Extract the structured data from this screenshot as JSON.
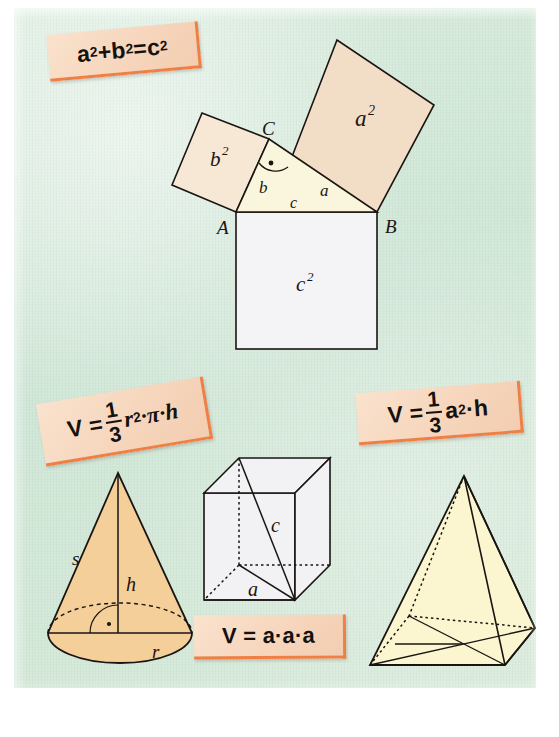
{
  "page": {
    "background_color": "#d6e9da",
    "panel_texture": "paper-grain"
  },
  "colors": {
    "background_green": "#d6e9da",
    "sticker_fill": "#f6d6bd",
    "sticker_edge": "#ef7f44",
    "square_a_fill": "#f2ddc7",
    "square_b_fill": "#f7e7d5",
    "square_c_fill": "#f4f3f6",
    "triangle_fill": "#faf6dd",
    "cone_fill": "#f5cf9a",
    "cube_fill": "#f2f2f5",
    "pyramid_fill": "#fbf6d0",
    "stroke": "#1a1512"
  },
  "stickers": [
    {
      "id": "pythagoras",
      "name": "pythagorean-theorem-formula",
      "parts": [
        "a",
        "2",
        " + ",
        "b",
        "2",
        " = ",
        "c",
        "2"
      ],
      "plain_text": "a² + b² = c²"
    },
    {
      "id": "cone",
      "name": "cone-volume-formula",
      "lead": "V =",
      "numerator": "1",
      "denominator": "3",
      "tail_base": "r",
      "tail_exp": "2",
      "tail_rest": "·π·h",
      "plain_text": "V = 1/3 r²·π·h"
    },
    {
      "id": "pyramid",
      "name": "pyramid-volume-formula",
      "lead": "V =",
      "numerator": "1",
      "denominator": "3",
      "tail_base": "a",
      "tail_exp": "2",
      "tail_rest": "·h",
      "plain_text": "V = 1/3 a²·h"
    },
    {
      "id": "cube",
      "name": "cube-volume-formula",
      "plain_text": "V = a·a·a"
    }
  ],
  "pythagoras_figure": {
    "name": "pythagorean-theorem-diagram",
    "vertex_labels": {
      "A": "A",
      "B": "B",
      "C": "C"
    },
    "side_labels": {
      "a": "a",
      "b": "b",
      "c": "c"
    },
    "square_labels": {
      "a2": "a",
      "a2_exp": "2",
      "b2": "b",
      "b2_exp": "2",
      "c2": "c",
      "c2_exp": "2"
    },
    "right_angle_at": "C",
    "right_angle_marker": "arc-with-dot"
  },
  "cone_figure": {
    "name": "cone-diagram",
    "labels": {
      "slant": "s",
      "height": "h",
      "radius": "r"
    },
    "right_angle_marker": "arc-with-dot",
    "base": "ellipse-with-dashed-back-arc"
  },
  "cube_figure": {
    "name": "cube-diagram",
    "labels": {
      "edge": "a",
      "space_diagonal": "c"
    },
    "hidden_edges": "dotted"
  },
  "pyramid_figure": {
    "name": "square-pyramid-diagram",
    "labels": {},
    "hidden_edges": "dotted",
    "base": "square-in-perspective-with-diagonals"
  }
}
